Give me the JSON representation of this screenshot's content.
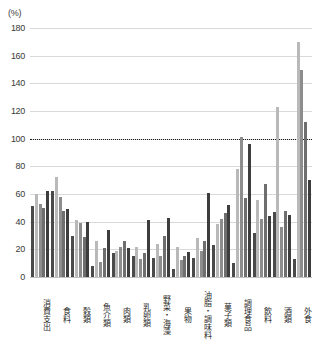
{
  "chart_data": {
    "type": "bar",
    "title": "",
    "xlabel": "",
    "ylabel": "(%)",
    "ylim": [
      0,
      180
    ],
    "yticks": [
      0,
      20,
      40,
      60,
      80,
      100,
      120,
      140,
      160,
      180
    ],
    "grid": true,
    "legend": "none",
    "reference_line": 100,
    "categories": [
      "消費支出",
      "食料",
      "穀類",
      "魚介類",
      "肉類",
      "乳卵類",
      "野菜・海藻",
      "果物",
      "油脂・調味料",
      "菓子類",
      "調理食品",
      "飲料",
      "酒類",
      "外食"
    ],
    "series": [
      {
        "name": "series-1",
        "values": [
          51,
          62,
          30,
          8,
          17,
          15,
          14,
          6,
          14,
          23,
          10,
          32,
          47,
          13
        ]
      },
      {
        "name": "series-2",
        "values": [
          60,
          72,
          41,
          26,
          19,
          22,
          24,
          22,
          28,
          38,
          78,
          56,
          123,
          170
        ]
      },
      {
        "name": "series-3",
        "values": [
          53,
          58,
          39,
          11,
          22,
          13,
          15,
          12,
          19,
          42,
          101,
          42,
          36,
          150
        ]
      },
      {
        "name": "series-4",
        "values": [
          50,
          48,
          29,
          21,
          26,
          17,
          30,
          15,
          26,
          46,
          57,
          67,
          48,
          112
        ]
      },
      {
        "name": "series-5",
        "values": [
          62,
          49,
          40,
          34,
          21,
          41,
          43,
          18,
          61,
          52,
          96,
          44,
          45,
          70
        ]
      }
    ]
  }
}
